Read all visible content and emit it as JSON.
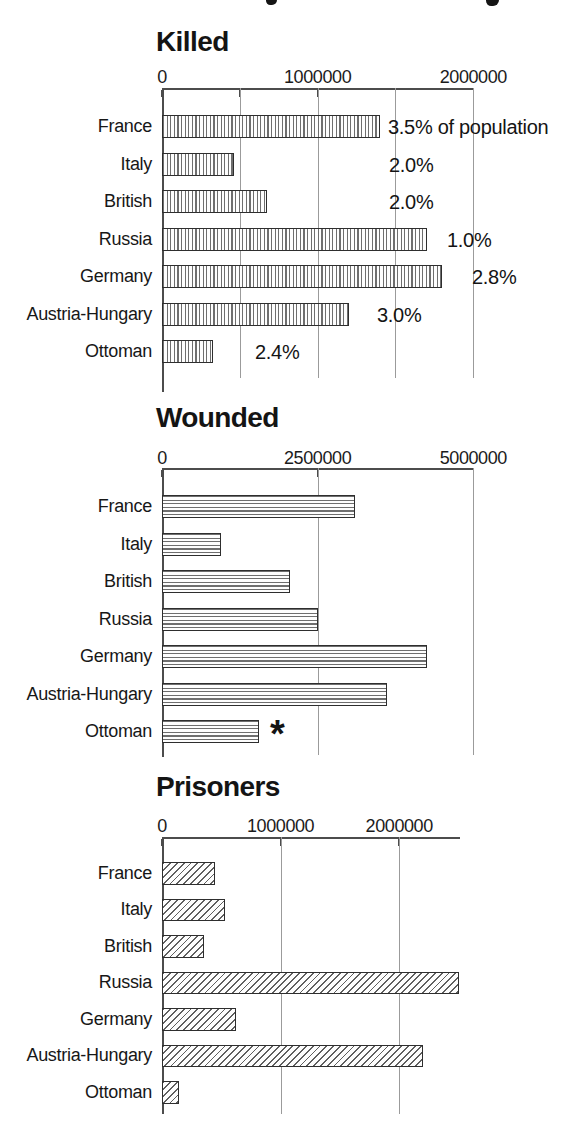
{
  "page": {
    "background": "#ffffff",
    "text_color": "#161616",
    "top_edge_fragments": "two cut-off letter descenders from a caption cropped above"
  },
  "chart_data": [
    {
      "type": "bar",
      "orientation": "horizontal",
      "title": "Killed",
      "hatch": "vertical",
      "categories": [
        "France",
        "Italy",
        "British",
        "Russia",
        "Germany",
        "Austria-Hungary",
        "Ottoman"
      ],
      "values": [
        1400000,
        460000,
        675000,
        1700000,
        1800000,
        1200000,
        325000
      ],
      "annotations": [
        "3.5% of population",
        "2.0%",
        "2.0%",
        "1.0%",
        "2.8%",
        "3.0%",
        "2.4%"
      ],
      "axis": {
        "min": 0,
        "max": 2000000,
        "ticks": [
          {
            "value": 0,
            "label": "0"
          },
          {
            "value": 1000000,
            "label": "1000000"
          },
          {
            "value": 2000000,
            "label": "2000000"
          }
        ],
        "tick_marks": [
          0,
          500000,
          1000000,
          1500000,
          2000000
        ],
        "gridlines": [
          500000,
          1000000,
          1500000,
          2000000
        ],
        "grid": true,
        "legend": "none"
      }
    },
    {
      "type": "bar",
      "orientation": "horizontal",
      "title": "Wounded",
      "hatch": "horizontal",
      "categories": [
        "France",
        "Italy",
        "British",
        "Russia",
        "Germany",
        "Austria-Hungary",
        "Ottoman"
      ],
      "values": [
        3100000,
        950000,
        2050000,
        2500000,
        4250000,
        3620000,
        1550000
      ],
      "annotations": [
        "",
        "",
        "",
        "",
        "",
        "",
        "*"
      ],
      "axis": {
        "min": 0,
        "max": 5000000,
        "ticks": [
          {
            "value": 0,
            "label": "0"
          },
          {
            "value": 2500000,
            "label": "2500000"
          },
          {
            "value": 5000000,
            "label": "5000000"
          }
        ],
        "tick_marks": [
          0,
          2500000,
          5000000
        ],
        "gridlines": [
          2500000,
          5000000
        ],
        "grid": true,
        "legend": "none"
      }
    },
    {
      "type": "bar",
      "orientation": "horizontal",
      "title": "Prisoners",
      "hatch": "diagonal",
      "categories": [
        "France",
        "Italy",
        "British",
        "Russia",
        "Germany",
        "Austria-Hungary",
        "Ottoman"
      ],
      "values": [
        450000,
        530000,
        350000,
        2500000,
        620000,
        2200000,
        140000
      ],
      "annotations": [
        "",
        "",
        "",
        "",
        "",
        "",
        ""
      ],
      "axis": {
        "min": 0,
        "max": 2510000,
        "ticks": [
          {
            "value": 0,
            "label": "0"
          },
          {
            "value": 1000000,
            "label": "1000000"
          },
          {
            "value": 2000000,
            "label": "2000000"
          }
        ],
        "tick_marks": [
          0,
          1000000,
          2000000
        ],
        "gridlines": [
          1000000,
          2000000
        ],
        "grid": true,
        "legend": "none"
      }
    }
  ]
}
